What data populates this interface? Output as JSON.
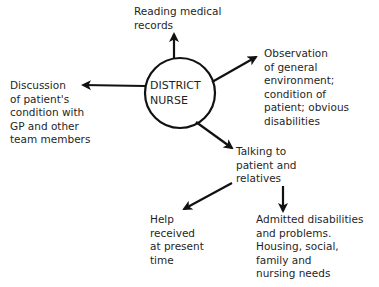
{
  "diagram": {
    "center": {
      "text": "DISTRICT\nNURSE"
    },
    "nodes": {
      "reading": {
        "text": "Reading medical\nrecords"
      },
      "observation": {
        "text": "Observation\nof general\nenvironment;\ncondition of\npatient; obvious\ndisabilities"
      },
      "discussion": {
        "text": "Discussion\nof patient's\ncondition with\nGP and other\nteam members"
      },
      "talking": {
        "text": "Talking to\npatient and\nrelatives"
      },
      "help": {
        "text": "Help\nreceived\nat present\ntime"
      },
      "admitted": {
        "text": "Admitted disabilities\nand problems.\nHousing, social,\nfamily and\nnursing needs"
      }
    },
    "edges": [
      {
        "from": "DISTRICT NURSE",
        "to": "Reading medical records"
      },
      {
        "from": "DISTRICT NURSE",
        "to": "Observation of general environment"
      },
      {
        "from": "DISTRICT NURSE",
        "to": "Discussion of patient's condition"
      },
      {
        "from": "DISTRICT NURSE",
        "to": "Talking to patient and relatives"
      },
      {
        "from": "Talking to patient and relatives",
        "to": "Help received at present time"
      },
      {
        "from": "Talking to patient and relatives",
        "to": "Admitted disabilities and problems"
      }
    ],
    "colors": {
      "line": "#111111",
      "text": "#1f1f1f",
      "background": "#ffffff"
    }
  }
}
